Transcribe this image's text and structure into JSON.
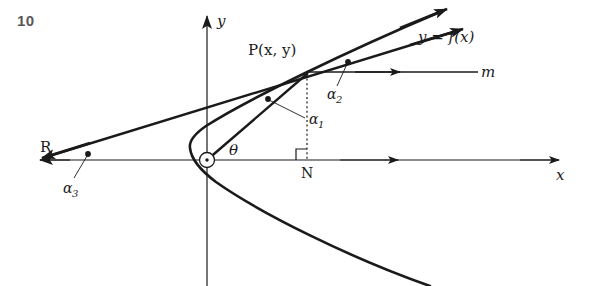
{
  "page": {
    "problem_number": "10",
    "background_color": "#ffffff",
    "ink_color": "#1a1a1a",
    "number_color": "#58585a"
  },
  "figure": {
    "type": "geometry-diagram",
    "axes": {
      "x_axis_label": "x",
      "y_axis_label": "y",
      "origin_label": "O",
      "x_axis_y_pixel": 160,
      "y_axis_x_pixel": 207
    },
    "points": [
      {
        "name": "P",
        "label": "P(x, y)",
        "x": 307,
        "y": 72
      },
      {
        "name": "N",
        "label": "N",
        "x": 307,
        "y": 160
      },
      {
        "name": "R",
        "label": "R",
        "x": 52,
        "y": 160
      },
      {
        "name": "O",
        "label": "O",
        "x": 207,
        "y": 160
      }
    ],
    "curve": {
      "label": "y = f(x)",
      "kind": "parabola-opening-right",
      "vertex_pixel": [
        190,
        147
      ]
    },
    "lines": [
      {
        "name": "tangent-line",
        "endpoint_label": "R",
        "through": "P"
      },
      {
        "name": "horizontal-line-m",
        "label": "m"
      },
      {
        "name": "radius-vector-OP",
        "angle_label": "θ"
      }
    ],
    "angle_labels": [
      {
        "name": "alpha-1",
        "base": "α",
        "subscript": "1",
        "at_vertex": "P-between-OP-and-vertical"
      },
      {
        "name": "alpha-2",
        "base": "α",
        "subscript": "2",
        "at_vertex": "P-between-tangent-and-m"
      },
      {
        "name": "alpha-3",
        "base": "α",
        "subscript": "3",
        "at_vertex": "R-between-tangent-and-x-axis"
      },
      {
        "name": "theta",
        "base": "θ",
        "subscript": "",
        "at_vertex": "O-between-OP-and-x-axis"
      }
    ],
    "right_angle_marker": {
      "at": "N",
      "size": 11
    },
    "dotted_segment": {
      "from": "P",
      "to": "N"
    }
  }
}
